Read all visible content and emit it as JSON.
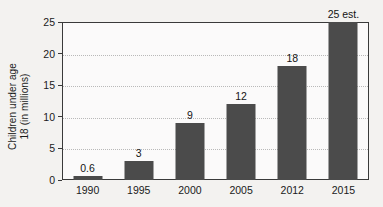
{
  "chart_data": {
    "type": "bar",
    "title": "",
    "subtitle": "",
    "xlabel": "",
    "ylabel": "Children under age 18 (in millions)",
    "ylabel_lines": [
      "Children under age",
      "18 (in millions)"
    ],
    "categories": [
      "1990",
      "1995",
      "2000",
      "2005",
      "2012",
      "2015"
    ],
    "values": [
      0.6,
      3,
      9,
      12,
      18,
      25
    ],
    "data_labels": [
      "0.6",
      "3",
      "9",
      "12",
      "18",
      "25 est."
    ],
    "ylim": [
      0,
      25
    ],
    "yticks": [
      0,
      5,
      10,
      15,
      20,
      25
    ],
    "ytick_labels": [
      "0",
      "5",
      "10",
      "15",
      "20",
      "25"
    ],
    "grid": true,
    "grid_axis": "y",
    "legend": "none",
    "bar_color": "#4b4b4b",
    "background_color": "#f3f2f0",
    "plot_background_color": "#fbfafa",
    "gridline_color": "#b9b9b9",
    "axis_color": "#3a3a3a",
    "text_color": "#1a1a1a"
  }
}
